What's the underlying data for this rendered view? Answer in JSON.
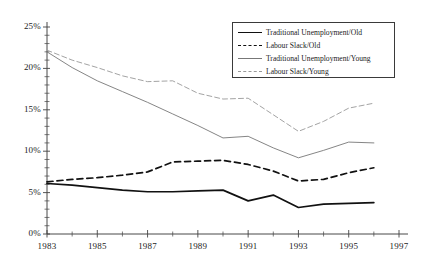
{
  "chart_data": {
    "type": "line",
    "title": "",
    "xlabel": "",
    "ylabel": "",
    "xlim": [
      1983,
      1997
    ],
    "ylim": [
      0,
      25
    ],
    "grid": false,
    "legend_position": "top-right",
    "x_tick_labels": [
      "1983",
      "1985",
      "1987",
      "1989",
      "1991",
      "1993",
      "1995",
      "1997"
    ],
    "x_tick_values": [
      1983,
      1985,
      1987,
      1989,
      1991,
      1993,
      1995,
      1997
    ],
    "x_minor_ticks": [
      1984,
      1986,
      1988,
      1990,
      1992,
      1994,
      1996
    ],
    "y_tick_labels": [
      "0%",
      "5%",
      "10%",
      "15%",
      "20%",
      "25%"
    ],
    "y_tick_values": [
      0,
      5,
      10,
      15,
      20,
      25
    ],
    "x": [
      1983,
      1984,
      1985,
      1986,
      1987,
      1988,
      1989,
      1990,
      1991,
      1992,
      1993,
      1994,
      1995,
      1996
    ],
    "series": [
      {
        "name": "Traditional Unemployment/Old",
        "style": "solid-thick",
        "color": "#111111",
        "values": [
          6.1,
          5.9,
          5.6,
          5.3,
          5.1,
          5.1,
          5.2,
          5.3,
          4.0,
          4.7,
          3.2,
          3.6,
          3.7,
          3.8
        ]
      },
      {
        "name": "Labour Slack/Old",
        "style": "dashed-thick",
        "color": "#111111",
        "values": [
          6.3,
          6.6,
          6.8,
          7.1,
          7.5,
          8.7,
          8.8,
          8.9,
          8.4,
          7.6,
          6.4,
          6.6,
          7.4,
          8.0
        ]
      },
      {
        "name": "Traditional Unemployment/Young",
        "style": "solid-thin",
        "color": "#777777",
        "values": [
          22.0,
          20.1,
          18.5,
          17.2,
          15.9,
          14.5,
          13.1,
          11.6,
          11.8,
          10.4,
          9.2,
          10.1,
          11.1,
          11.0
        ]
      },
      {
        "name": "Labour Slack/Young",
        "style": "dashed-thin",
        "color": "#999999",
        "values": [
          22.2,
          21.0,
          20.1,
          19.1,
          18.4,
          18.5,
          17.0,
          16.3,
          16.4,
          14.4,
          12.4,
          13.6,
          15.2,
          15.8
        ]
      }
    ]
  },
  "legend": {
    "items": [
      {
        "label": "Traditional Unemployment/Old",
        "style": "solid-thick"
      },
      {
        "label": "Labour Slack/Old",
        "style": "dashed-thick"
      },
      {
        "label": "Traditional Unemployment/Young",
        "style": "solid-thin"
      },
      {
        "label": "Labour Slack/Young",
        "style": "dashed-thin"
      }
    ]
  },
  "axes": {
    "y_labels": [
      "25%",
      "20%",
      "15%",
      "10%",
      "5%",
      "0%"
    ],
    "x_labels": [
      "1983",
      "1985",
      "1987",
      "1989",
      "1991",
      "1993",
      "1995",
      "1997"
    ]
  }
}
